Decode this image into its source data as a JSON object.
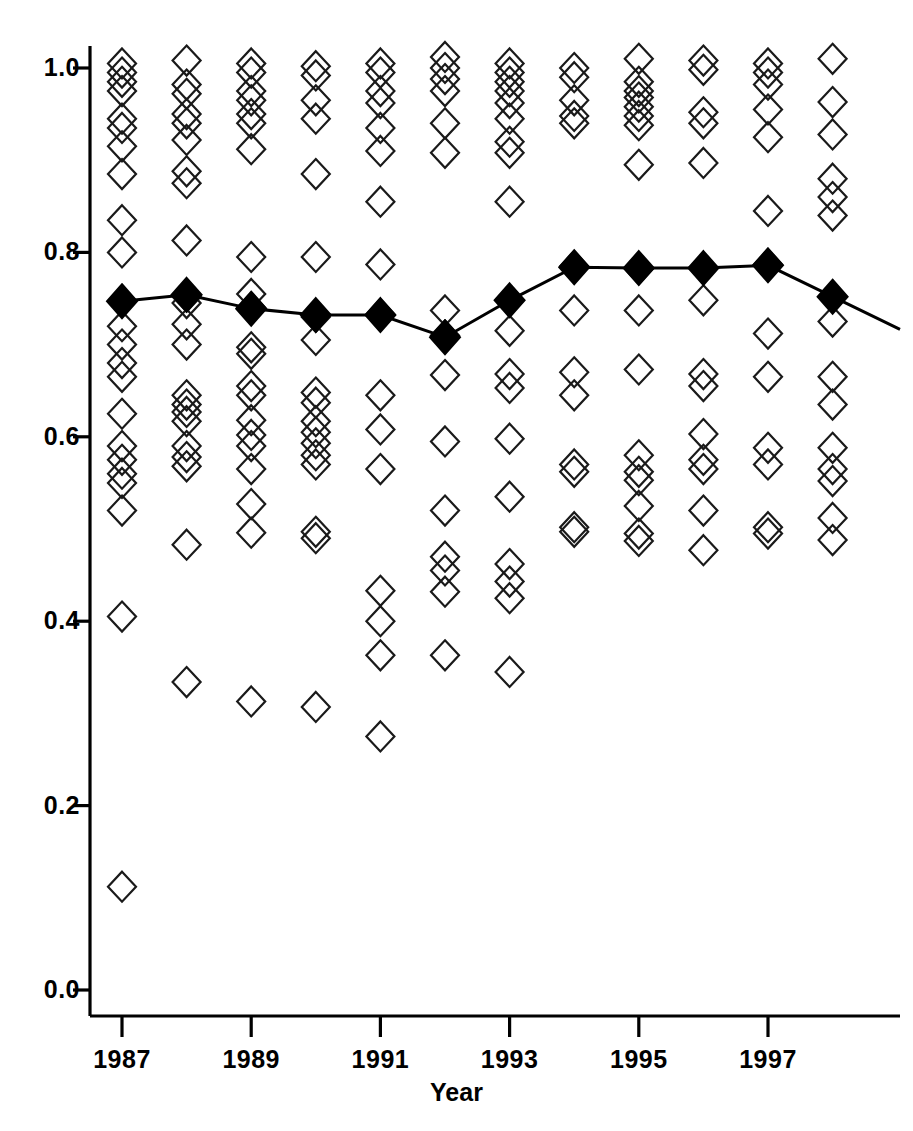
{
  "chart_data": {
    "type": "scatter",
    "title": "",
    "subtitle": "",
    "xlabel": "Year",
    "ylabel": "",
    "xlim": [
      1986.4,
      1998.7
    ],
    "ylim": [
      -0.03,
      1.06
    ],
    "grid": false,
    "legend_position": "none",
    "x_ticks": [
      1987,
      1989,
      1991,
      1993,
      1995,
      1997
    ],
    "x_tick_labels": [
      "1987",
      "1989",
      "1991",
      "1993",
      "1995",
      "1997"
    ],
    "x_minor_ticks": [
      1988,
      1990,
      1992,
      1994,
      1996,
      1998
    ],
    "y_ticks": [
      0.0,
      0.2,
      0.4,
      0.6,
      0.8,
      1.0
    ],
    "y_tick_labels": [
      "0.0",
      "0.2",
      "0.4",
      "0.6",
      "0.8",
      "1.0"
    ],
    "marker_open": "open-diamond",
    "marker_filled": "filled-diamond",
    "series": [
      {
        "name": "Individual observations",
        "marker": "open-diamond",
        "x": [
          1987,
          1988,
          1989,
          1990,
          1991,
          1992,
          1993,
          1994,
          1995,
          1996,
          1997,
          1998
        ],
        "values_by_year": {
          "1987": [
            1.005,
            0.995,
            0.985,
            0.975,
            0.945,
            0.935,
            0.915,
            0.885,
            0.835,
            0.8,
            0.72,
            0.7,
            0.68,
            0.665,
            0.625,
            0.59,
            0.575,
            0.56,
            0.55,
            0.52,
            0.405,
            0.112
          ],
          "1988": [
            1.008,
            0.982,
            0.972,
            0.95,
            0.94,
            0.922,
            0.888,
            0.875,
            0.813,
            0.752,
            0.745,
            0.722,
            0.7,
            0.645,
            0.635,
            0.627,
            0.617,
            0.59,
            0.578,
            0.568,
            0.483,
            0.334
          ],
          "1989": [
            1.005,
            0.995,
            0.975,
            0.965,
            0.95,
            0.94,
            0.912,
            0.795,
            0.755,
            0.74,
            0.697,
            0.69,
            0.655,
            0.645,
            0.618,
            0.602,
            0.59,
            0.565,
            0.527,
            0.496,
            0.313
          ],
          "1990": [
            1.002,
            0.992,
            0.965,
            0.945,
            0.885,
            0.795,
            0.73,
            0.705,
            0.648,
            0.637,
            0.617,
            0.605,
            0.593,
            0.58,
            0.57,
            0.497,
            0.49,
            0.307
          ],
          "1991": [
            1.005,
            0.995,
            0.975,
            0.962,
            0.935,
            0.91,
            0.855,
            0.787,
            0.733,
            0.645,
            0.608,
            0.565,
            0.433,
            0.4,
            0.363,
            0.275
          ],
          "1992": [
            1.012,
            1.0,
            0.988,
            0.975,
            0.94,
            0.908,
            0.737,
            0.71,
            0.667,
            0.595,
            0.52,
            0.47,
            0.455,
            0.432,
            0.363
          ],
          "1993": [
            1.005,
            0.995,
            0.985,
            0.975,
            0.962,
            0.945,
            0.92,
            0.908,
            0.855,
            0.748,
            0.715,
            0.668,
            0.653,
            0.598,
            0.535,
            0.462,
            0.443,
            0.425,
            0.345
          ],
          "1994": [
            1.0,
            0.99,
            0.965,
            0.948,
            0.94,
            0.785,
            0.737,
            0.67,
            0.645,
            0.57,
            0.562,
            0.502,
            0.497
          ],
          "1995": [
            1.01,
            0.985,
            0.975,
            0.968,
            0.958,
            0.948,
            0.938,
            0.895,
            0.782,
            0.737,
            0.673,
            0.58,
            0.562,
            0.553,
            0.525,
            0.495,
            0.487
          ],
          "1996": [
            1.008,
            0.998,
            0.952,
            0.94,
            0.897,
            0.783,
            0.748,
            0.668,
            0.655,
            0.603,
            0.575,
            0.565,
            0.52,
            0.477
          ],
          "1997": [
            1.005,
            0.995,
            0.982,
            0.955,
            0.925,
            0.845,
            0.787,
            0.712,
            0.665,
            0.588,
            0.57,
            0.502,
            0.495
          ],
          "1998": [
            1.01,
            0.963,
            0.928,
            0.88,
            0.86,
            0.84,
            0.752,
            0.725,
            0.665,
            0.635,
            0.588,
            0.565,
            0.552,
            0.512,
            0.488
          ]
        }
      },
      {
        "name": "Mean",
        "marker": "filled-diamond",
        "line": true,
        "x": [
          1987,
          1988,
          1989,
          1990,
          1991,
          1992,
          1993,
          1994,
          1995,
          1996,
          1997,
          1998
        ],
        "values": [
          0.747,
          0.754,
          0.739,
          0.732,
          0.732,
          0.708,
          0.748,
          0.784,
          0.783,
          0.783,
          0.786,
          0.752
        ]
      }
    ]
  },
  "axis": {
    "x_title": "Year"
  }
}
